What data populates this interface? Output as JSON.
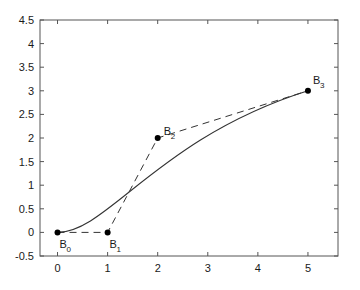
{
  "chart_data": {
    "type": "line",
    "title": "",
    "xlabel": "",
    "ylabel": "",
    "xlim": [
      -0.35,
      5.6
    ],
    "ylim": [
      -0.5,
      4.5
    ],
    "grid": false,
    "legend": null,
    "xticks": [
      "0",
      "1",
      "2",
      "3",
      "4",
      "5"
    ],
    "xtick_values": [
      0,
      1,
      2,
      3,
      4,
      5
    ],
    "yticks": [
      "-0.5",
      "0",
      "0.5",
      "1",
      "1.5",
      "2",
      "2.5",
      "3",
      "3.5",
      "4",
      "4.5"
    ],
    "ytick_values": [
      -0.5,
      0,
      0.5,
      1,
      1.5,
      2,
      2.5,
      3,
      3.5,
      4,
      4.5
    ],
    "series": [
      {
        "name": "bezier-curve",
        "style": "solid",
        "color": "#333333",
        "description": "cubic Bezier curve defined by the four control points"
      },
      {
        "name": "control-polygon",
        "style": "dashed",
        "color": "#333333",
        "values": [
          [
            0,
            0
          ],
          [
            1,
            0
          ],
          [
            2,
            2
          ],
          [
            5,
            3
          ]
        ]
      }
    ],
    "control_points": [
      {
        "label": "B",
        "sub": "0",
        "x": 0,
        "y": 0,
        "label_dx": 2,
        "label_dy": 16
      },
      {
        "label": "B",
        "sub": "1",
        "x": 1,
        "y": 0,
        "label_dx": 2,
        "label_dy": 16
      },
      {
        "label": "B",
        "sub": "2",
        "x": 2,
        "y": 2,
        "label_dx": 6,
        "label_dy": -3
      },
      {
        "label": "B",
        "sub": "3",
        "x": 5,
        "y": 3,
        "label_dx": 5,
        "label_dy": -7
      }
    ],
    "colors": {
      "axis": "#555555",
      "curve": "#333333",
      "polygon": "#333333",
      "point": "#000000",
      "background": "#ffffff"
    }
  }
}
